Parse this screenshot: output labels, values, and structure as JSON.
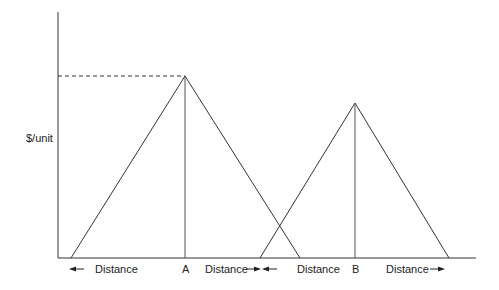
{
  "diagram": {
    "type": "price-distance-triangles",
    "y_axis_label": "$/unit",
    "markets": [
      {
        "name": "A",
        "peak": [
          185,
          76
        ],
        "left_foot": [
          71,
          258
        ],
        "right_foot": [
          300,
          258
        ]
      },
      {
        "name": "B",
        "peak": [
          355,
          103
        ],
        "left_foot": [
          260,
          258
        ],
        "right_foot": [
          449,
          258
        ]
      }
    ],
    "dashed_reference_from_peak": "A",
    "labels": {
      "a_left": "Distance",
      "a_point": "A",
      "a_right": "Distance",
      "b_left": "Distance",
      "b_point": "B",
      "b_right": "Distance"
    },
    "colors": {
      "line": "#333333",
      "text": "#222222",
      "background": "#ffffff"
    }
  }
}
